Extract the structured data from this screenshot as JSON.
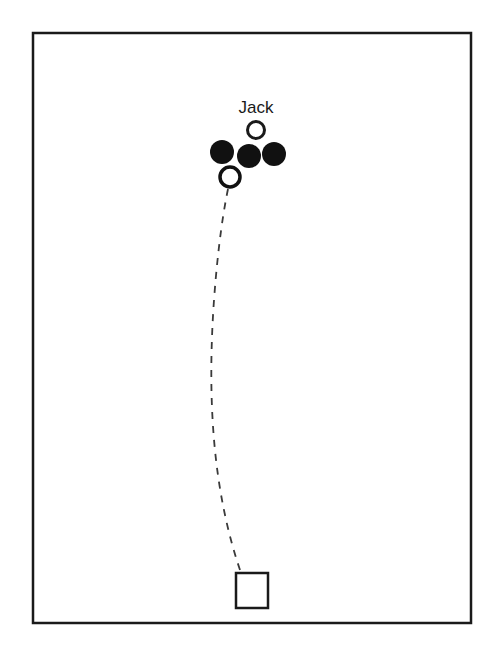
{
  "figure": {
    "background_color": "#ffffff",
    "ink_color": "#1a1a1a",
    "width": 496,
    "height": 654
  },
  "field": {
    "name": "playing-area-frame",
    "x": 33,
    "y": 33,
    "width": 438,
    "height": 590,
    "stroke_color": "#1a1a1a",
    "stroke_width": 2.5,
    "fill": "#ffffff"
  },
  "labels": [
    {
      "id": "jack-label",
      "text": "Jack",
      "x": 256,
      "y": 113,
      "font_size": 17,
      "color": "#1a1a1a"
    }
  ],
  "balls": [
    {
      "id": "jack-ball",
      "kind": "open",
      "label": "Jack",
      "cx": 256,
      "cy": 130,
      "r": 8.5,
      "stroke_width": 3,
      "stroke_color": "#1a1a1a",
      "fill_color": "#ffffff"
    },
    {
      "id": "boule-left",
      "kind": "filled",
      "label": "",
      "cx": 222,
      "cy": 152,
      "r": 12,
      "stroke_width": 0,
      "stroke_color": "#111111",
      "fill_color": "#111111"
    },
    {
      "id": "boule-center",
      "kind": "filled",
      "label": "",
      "cx": 249,
      "cy": 156,
      "r": 12,
      "stroke_width": 0,
      "stroke_color": "#111111",
      "fill_color": "#111111"
    },
    {
      "id": "boule-right",
      "kind": "filled",
      "label": "",
      "cx": 274,
      "cy": 154,
      "r": 12,
      "stroke_width": 0,
      "stroke_color": "#111111",
      "fill_color": "#111111"
    },
    {
      "id": "thrown-boule",
      "kind": "open",
      "label": "",
      "cx": 230,
      "cy": 177,
      "r": 10,
      "stroke_width": 3.5,
      "stroke_color": "#111111",
      "fill_color": "#ffffff"
    }
  ],
  "throwing_circle": {
    "id": "throwing-position-square",
    "shape": "square",
    "x": 236,
    "y": 573,
    "width": 32,
    "height": 35,
    "stroke_color": "#1a1a1a",
    "stroke_width": 2.5,
    "fill": "#ffffff"
  },
  "trajectory": {
    "id": "throw-trajectory",
    "style": "dashed",
    "stroke_color": "#3a3a3a",
    "stroke_width": 1.8,
    "dash_pattern": "7 7",
    "path": "M 240 570 C 213 490 207 400 214 300 C 218 245 224 208 228 189",
    "start_point": [
      240,
      570
    ],
    "end_point": [
      228,
      189
    ],
    "description": "dashed curved path from throwing square up to the thrown boule"
  }
}
